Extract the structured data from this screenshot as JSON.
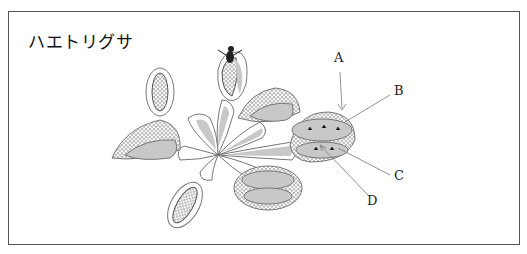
{
  "diagram": {
    "title": "ハエトリグサ",
    "labels": [
      {
        "id": "A",
        "text": "A"
      },
      {
        "id": "B",
        "text": "B"
      },
      {
        "id": "C",
        "text": "C"
      },
      {
        "id": "D",
        "text": "D"
      }
    ],
    "colors": {
      "fill": "#c8c8c8",
      "stroke": "#666666",
      "frame": "#555555"
    }
  }
}
